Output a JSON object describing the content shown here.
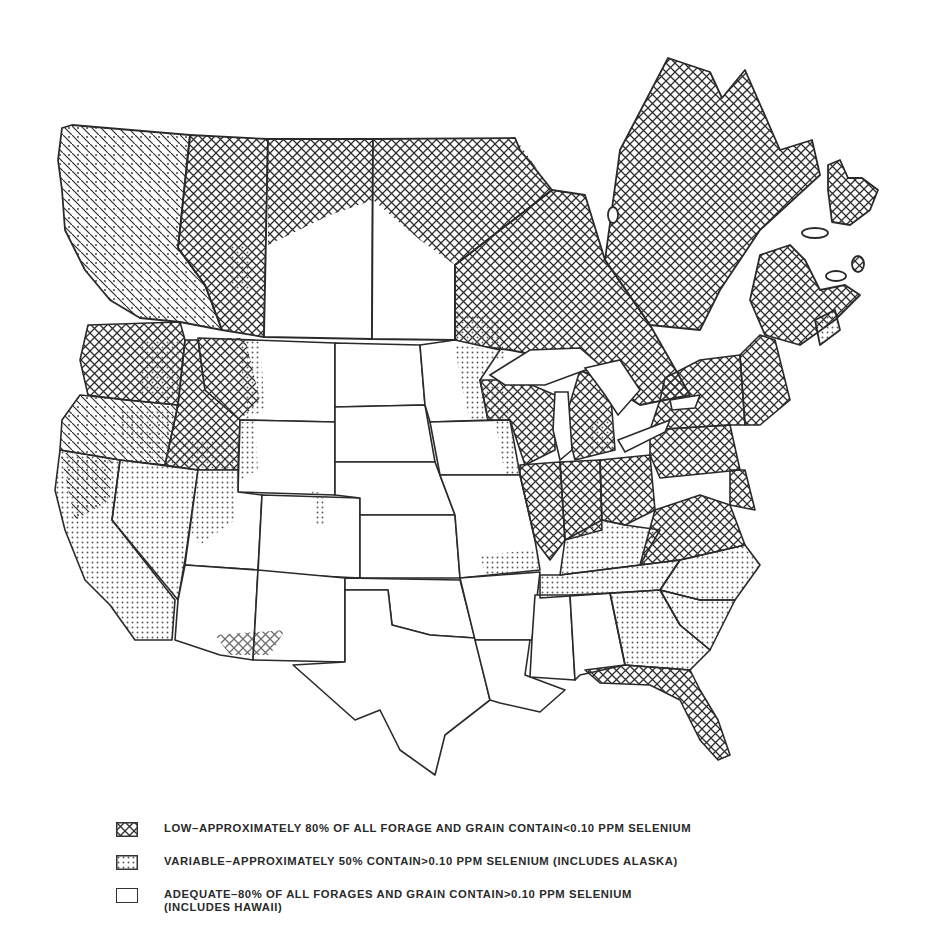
{
  "map": {
    "title": "Selenium content of forage and grain in the United States and Canada",
    "regions_description": "Conterminous United States and southern Canadian provinces shaded by selenium category",
    "categories": [
      {
        "id": "low",
        "pattern": "crosshatch",
        "color": "#333333"
      },
      {
        "id": "variable",
        "pattern": "stipple",
        "color": "#555555"
      },
      {
        "id": "adequate",
        "pattern": "blank",
        "color": "#ffffff"
      }
    ]
  },
  "legend": {
    "items": [
      {
        "id": "low",
        "text": "LOW–APPROXIMATELY 80% OF ALL FORAGE AND GRAIN CONTAIN<0.10 PPM SELENIUM"
      },
      {
        "id": "variable",
        "text": "VARIABLE–APPROXIMATELY 50% CONTAIN>0.10 PPM SELENIUM (INCLUDES ALASKA)"
      },
      {
        "id": "adequate",
        "text": "ADEQUATE–80% OF ALL FORAGES AND GRAIN CONTAIN>0.10 PPM SELENIUM",
        "text2": "(INCLUDES HAWAII)"
      }
    ]
  }
}
